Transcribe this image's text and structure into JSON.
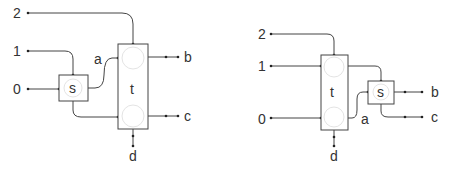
{
  "diagrams": [
    {
      "id": "left",
      "description": "s feeds t",
      "inputs": [
        "2",
        "1",
        "0"
      ],
      "nodes": [
        {
          "id": "s",
          "label": "s"
        },
        {
          "id": "t",
          "label": "t"
        }
      ],
      "outputs": [
        "b",
        "c",
        "d"
      ],
      "internal_labels": [
        "a"
      ],
      "edges": [
        {
          "from": "2",
          "to": "t"
        },
        {
          "from": "1",
          "to": "s"
        },
        {
          "from": "0",
          "to": "s"
        },
        {
          "from": "s",
          "to": "t",
          "label": "a"
        },
        {
          "from": "s",
          "to": "t"
        },
        {
          "from": "t",
          "to": "b"
        },
        {
          "from": "t",
          "to": "c"
        },
        {
          "from": "t",
          "to": "d"
        }
      ]
    },
    {
      "id": "right",
      "description": "t feeds s",
      "inputs": [
        "2",
        "1",
        "0"
      ],
      "nodes": [
        {
          "id": "t",
          "label": "t"
        },
        {
          "id": "s",
          "label": "s"
        }
      ],
      "outputs": [
        "b",
        "c",
        "d"
      ],
      "internal_labels": [
        "a"
      ],
      "edges": [
        {
          "from": "2",
          "to": "t"
        },
        {
          "from": "1",
          "to": "t"
        },
        {
          "from": "0",
          "to": "t"
        },
        {
          "from": "t",
          "to": "s"
        },
        {
          "from": "t",
          "to": "s",
          "label": "a"
        },
        {
          "from": "s",
          "to": "b"
        },
        {
          "from": "s",
          "to": "c"
        },
        {
          "from": "t",
          "to": "d"
        }
      ]
    }
  ],
  "colors": {
    "stroke": "#444444",
    "text": "#333333",
    "ghost": "#e4e4e4"
  }
}
